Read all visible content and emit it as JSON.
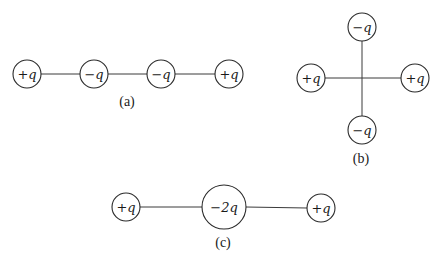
{
  "figure": {
    "panels": [
      {
        "label": "(a)",
        "label_pos": [
          127,
          106
        ],
        "charges": [
          {
            "text": "+q",
            "cx": 27,
            "cy": 74,
            "r": 14
          },
          {
            "text": "−q",
            "cx": 94,
            "cy": 74,
            "r": 14
          },
          {
            "text": "−q",
            "cx": 161,
            "cy": 74,
            "r": 14
          },
          {
            "text": "+q",
            "cx": 229,
            "cy": 74,
            "r": 14
          }
        ],
        "bonds": [
          [
            41,
            74,
            80,
            74
          ],
          [
            108,
            74,
            147,
            74
          ],
          [
            175,
            74,
            215,
            74
          ]
        ]
      },
      {
        "label": "(b)",
        "label_pos": [
          361,
          163
        ],
        "charges": [
          {
            "text": "−q",
            "cx": 362,
            "cy": 27,
            "r": 14
          },
          {
            "text": "+q",
            "cx": 311,
            "cy": 78,
            "r": 14
          },
          {
            "text": "+q",
            "cx": 415,
            "cy": 78,
            "r": 14
          },
          {
            "text": "−q",
            "cx": 362,
            "cy": 130,
            "r": 14
          }
        ],
        "bonds": [
          [
            325,
            78,
            401,
            78
          ],
          [
            362,
            41,
            362,
            116
          ]
        ]
      },
      {
        "label": "(c)",
        "label_pos": [
          223,
          247
        ],
        "charges": [
          {
            "text": "+q",
            "cx": 126,
            "cy": 207,
            "r": 14
          },
          {
            "text": "−2q",
            "cx": 224,
            "cy": 207,
            "r": 22
          },
          {
            "text": "+q",
            "cx": 321,
            "cy": 208,
            "r": 14
          }
        ],
        "bonds": [
          [
            140,
            207,
            202,
            207
          ],
          [
            246,
            207,
            307,
            208
          ]
        ]
      }
    ]
  }
}
